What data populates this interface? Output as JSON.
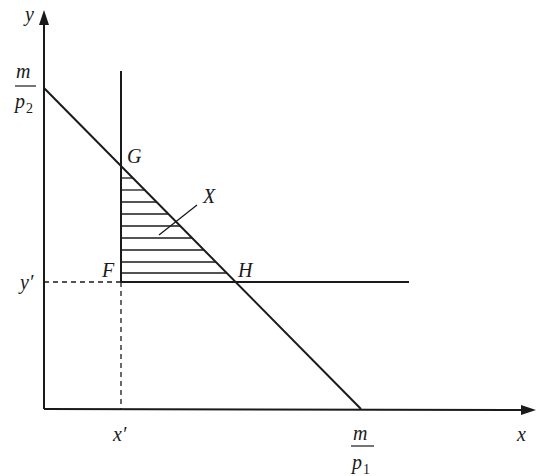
{
  "diagram": {
    "type": "budget-constraint-diagram",
    "axes": {
      "x_label": "x",
      "y_label": "y"
    },
    "intercepts": {
      "y_intercept": {
        "numerator": "m",
        "denominator_base": "p",
        "denominator_sub": "2"
      },
      "x_intercept": {
        "numerator": "m",
        "denominator_base": "p",
        "denominator_sub": "1"
      }
    },
    "reference_values": {
      "x_prime": "x′",
      "y_prime": "y′"
    },
    "points": {
      "F": "F",
      "G": "G",
      "H": "H"
    },
    "region_label": "X",
    "colors": {
      "line": "#1a1a1a",
      "background": "#ffffff"
    }
  }
}
